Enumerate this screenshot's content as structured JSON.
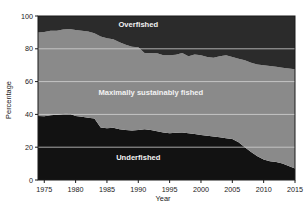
{
  "chart_data": {
    "type": "area",
    "stacked": true,
    "title": "",
    "xlabel": "Year",
    "ylabel": "Percentage",
    "xlim": [
      1974,
      2015
    ],
    "ylim": [
      0,
      100
    ],
    "xticks": [
      1975,
      1980,
      1985,
      1990,
      1995,
      2000,
      2005,
      2010,
      2015
    ],
    "yticks": [
      0,
      20,
      40,
      60,
      80,
      100
    ],
    "grid": "horizontal",
    "legend_position": "inline-band-labels",
    "colors": {
      "underfished": "#121212",
      "maximally_sustainably_fished": "#8a8a8a",
      "overfished": "#2b2b2b",
      "gridline": "#d8d8d8",
      "axis": "#1a1a1a",
      "band_label_text": "#f2f2f2",
      "background": "#ffffff"
    },
    "x": [
      1974,
      1975,
      1976,
      1977,
      1978,
      1979,
      1980,
      1981,
      1982,
      1983,
      1984,
      1985,
      1986,
      1987,
      1988,
      1989,
      1990,
      1991,
      1992,
      1993,
      1994,
      1995,
      1996,
      1997,
      1998,
      1999,
      2000,
      2001,
      2002,
      2003,
      2004,
      2005,
      2006,
      2007,
      2008,
      2009,
      2010,
      2011,
      2012,
      2013,
      2014,
      2015
    ],
    "series": [
      {
        "name": "Underfished",
        "label": "Underfished",
        "color": "#121212",
        "values": [
          39.0,
          38.8,
          39.5,
          39.8,
          40.2,
          40.5,
          39.0,
          38.5,
          38.0,
          37.5,
          32.0,
          31.5,
          31.8,
          31.0,
          30.5,
          30.2,
          30.5,
          31.0,
          30.5,
          29.8,
          29.0,
          28.5,
          28.8,
          29.0,
          28.5,
          28.0,
          27.5,
          27.0,
          26.5,
          26.0,
          25.5,
          25.0,
          23.0,
          20.0,
          17.0,
          14.5,
          12.5,
          11.5,
          11.0,
          10.0,
          8.5,
          7.0
        ]
      },
      {
        "name": "Maximally sustainably fished",
        "label": "Maximally sustainably fished",
        "color": "#8a8a8a",
        "values": [
          51.0,
          51.5,
          51.5,
          51.2,
          51.5,
          51.5,
          52.5,
          52.5,
          52.5,
          52.0,
          55.5,
          55.0,
          54.0,
          53.0,
          52.0,
          51.0,
          50.5,
          46.5,
          47.0,
          47.5,
          47.0,
          47.5,
          47.5,
          48.5,
          47.0,
          48.5,
          48.5,
          48.0,
          48.0,
          49.5,
          50.5,
          50.0,
          51.0,
          53.0,
          54.5,
          56.0,
          57.5,
          58.0,
          58.0,
          58.5,
          59.5,
          60.5
        ]
      },
      {
        "name": "Overfished",
        "label": "Overfished",
        "color": "#2b2b2b",
        "values": [
          10.0,
          9.7,
          9.0,
          9.0,
          8.3,
          8.0,
          8.5,
          9.0,
          9.5,
          10.5,
          12.5,
          13.5,
          14.2,
          16.0,
          17.5,
          18.8,
          19.0,
          22.5,
          22.5,
          22.7,
          24.0,
          24.0,
          23.7,
          22.5,
          24.5,
          23.5,
          24.0,
          25.0,
          25.5,
          24.5,
          24.0,
          25.0,
          26.0,
          27.0,
          28.5,
          29.5,
          30.0,
          30.5,
          31.0,
          31.5,
          32.0,
          32.5
        ]
      }
    ],
    "cumulative_upper_boundaries": {
      "underfished_top": [
        39.0,
        38.8,
        39.5,
        39.8,
        40.2,
        40.5,
        39.0,
        38.5,
        38.0,
        37.5,
        32.0,
        31.5,
        31.8,
        31.0,
        30.5,
        30.2,
        30.5,
        31.0,
        30.5,
        29.8,
        29.0,
        28.5,
        28.8,
        29.0,
        28.5,
        28.0,
        27.5,
        27.0,
        26.5,
        26.0,
        25.5,
        25.0,
        23.0,
        20.0,
        17.0,
        14.5,
        12.5,
        11.5,
        11.0,
        10.0,
        8.5,
        7.0
      ],
      "maximally_fished_top": [
        90.0,
        90.3,
        91.0,
        91.0,
        91.7,
        92.0,
        91.5,
        91.0,
        90.5,
        89.5,
        87.5,
        86.5,
        85.8,
        84.0,
        82.5,
        81.2,
        81.0,
        77.5,
        77.5,
        77.3,
        76.0,
        76.0,
        76.3,
        77.5,
        75.5,
        76.5,
        76.0,
        75.0,
        74.5,
        75.5,
        76.0,
        75.0,
        74.0,
        73.0,
        71.5,
        70.5,
        70.0,
        69.5,
        69.0,
        68.5,
        68.0,
        67.5
      ]
    },
    "annotations": [
      {
        "text": "Overfished",
        "x": 1990,
        "y": 93
      },
      {
        "text": "Maximally sustainably fished",
        "x": 1992,
        "y": 52
      },
      {
        "text": "Underfished",
        "x": 1990,
        "y": 12
      }
    ]
  },
  "axes": {
    "y_title": "Percentage",
    "x_title": "Year",
    "y_tick_labels": [
      "0",
      "20",
      "40",
      "60",
      "80",
      "100"
    ],
    "x_tick_labels": [
      "1975",
      "1980",
      "1985",
      "1990",
      "1995",
      "2000",
      "2005",
      "2010",
      "2015"
    ]
  }
}
